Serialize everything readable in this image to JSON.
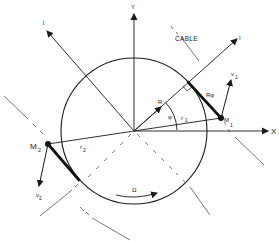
{
  "diagram": {
    "colors": {
      "line": "#1a1a1a",
      "dashed": "#555555",
      "background": "#ffffff"
    },
    "labels": {
      "y_axis": "Y",
      "x_axis": "X",
      "j_axis": "j",
      "i_axis": "I",
      "cable": "CABLE",
      "radius": "R",
      "phi": "φ",
      "r1": "r",
      "r1_sub": "1",
      "r2": "r",
      "r2_sub": "2",
      "r_phi": "Rφ",
      "m1": "M",
      "m1_sub": "1",
      "m2": "M",
      "m2_sub": "2",
      "v1": "v",
      "v1_sub": "1",
      "v2": "v",
      "v2_sub": "2",
      "omega": "Ω"
    },
    "geometry": {
      "origin": [
        134,
        131
      ],
      "circle_radius": 73,
      "m1": [
        221,
        118
      ],
      "m2": [
        48,
        144
      ],
      "tangent1": [
        188,
        82
      ],
      "tangent2": [
        79,
        180
      ]
    }
  }
}
